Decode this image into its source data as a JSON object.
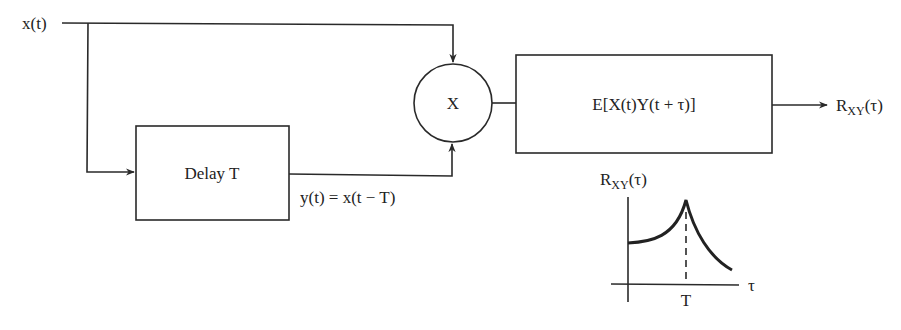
{
  "diagram": {
    "type": "block-diagram",
    "input_label": "x(t)",
    "delay_block": {
      "label": "Delay T"
    },
    "delayed_signal_label": "y(t) = x(t − T)",
    "multiplier": {
      "symbol": "X",
      "icon": "multiplier-circle"
    },
    "expectation_block": {
      "label": "E[X(t)Y(t + τ)]"
    },
    "output": {
      "base": "R",
      "subscript": "XY",
      "arg": "(τ)"
    },
    "inset_plot": {
      "title": {
        "base": "R",
        "subscript": "XY",
        "arg": "(τ)"
      },
      "x_axis_label": "τ",
      "x_tick_label": "T",
      "description": "Curve rises from a positive baseline to a sharp peak at τ = T, then decays"
    },
    "edges": [
      {
        "from": "input",
        "to": "multiplier"
      },
      {
        "from": "input",
        "to": "delay_block"
      },
      {
        "from": "delay_block",
        "to": "multiplier"
      },
      {
        "from": "multiplier",
        "to": "expectation_block"
      },
      {
        "from": "expectation_block",
        "to": "output"
      }
    ]
  }
}
